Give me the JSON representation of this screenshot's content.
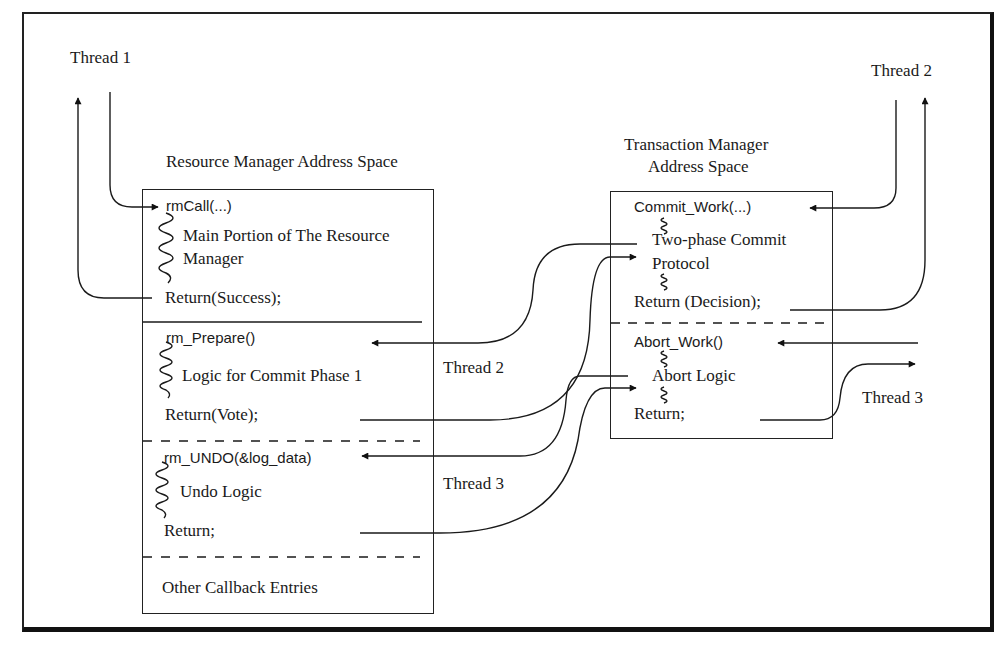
{
  "thread_labels": {
    "thread1": "Thread 1",
    "thread2_top": "Thread 2",
    "thread2_mid": "Thread 2",
    "thread3_mid": "Thread 3",
    "thread3_right": "Thread 3"
  },
  "resource_manager": {
    "heading": "Resource Manager Address Space",
    "sections": [
      {
        "entry": "rmCall(...)",
        "body_lines": [
          "Main Portion of The Resource",
          "Manager"
        ],
        "return": "Return(Success);",
        "divider_below": "solid"
      },
      {
        "entry": "rm_Prepare()",
        "body_lines": [
          "Logic for Commit Phase 1"
        ],
        "return": "Return(Vote);",
        "divider_below": "dashed"
      },
      {
        "entry": "rm_UNDO(&log_data)",
        "body_lines": [
          "Undo Logic"
        ],
        "return": "Return;",
        "divider_below": "dashed"
      },
      {
        "entry": "",
        "body_lines": [
          "Other Callback Entries"
        ],
        "return": ""
      }
    ]
  },
  "transaction_manager": {
    "heading_line1": "Transaction Manager",
    "heading_line2": "Address Space",
    "sections": [
      {
        "entry": "Commit_Work(...)",
        "body_lines": [
          "Two-phase Commit",
          "Protocol"
        ],
        "return": "Return (Decision);",
        "divider_below": "dashed"
      },
      {
        "entry": "Abort_Work()",
        "body_lines": [
          "Abort Logic"
        ],
        "return": "Return;"
      }
    ]
  },
  "colors": {
    "line": "#1a1a1a",
    "background": "#ffffff"
  }
}
